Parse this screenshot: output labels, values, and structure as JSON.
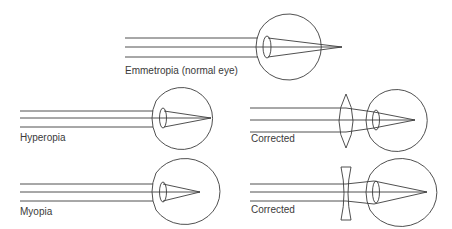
{
  "diagram": {
    "panels": [
      {
        "id": "emmetropia",
        "label": "Emmetropia (normal eye)",
        "focus": "on-retina",
        "correction": "none"
      },
      {
        "id": "hyperopia",
        "label": "Hyperopia",
        "focus": "behind-retina",
        "correction": "none"
      },
      {
        "id": "hyperopia-corrected",
        "label": "Corrected",
        "focus": "on-retina",
        "correction": "convex-lens"
      },
      {
        "id": "myopia",
        "label": "Myopia",
        "focus": "in-front-of-retina",
        "correction": "none"
      },
      {
        "id": "myopia-corrected",
        "label": "Corrected",
        "focus": "on-retina",
        "correction": "concave-lens"
      }
    ],
    "colors": {
      "line": "#3c3c3c",
      "text": "#3a3a3a",
      "background": "#ffffff"
    }
  }
}
